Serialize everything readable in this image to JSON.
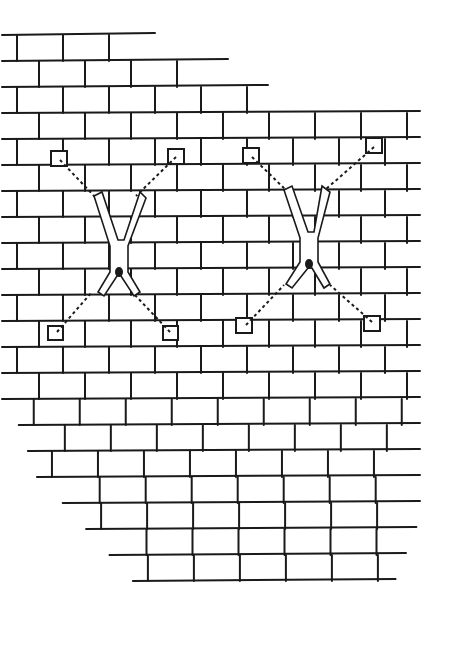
{
  "illustration": {
    "subject": "two figures chained spread-eagle upside-down to a brick wall",
    "style": "black ink line drawing on white",
    "colors": {
      "ink": "#1a1a1a",
      "paper": "#ffffff"
    },
    "figures": [
      {
        "name": "left-figure",
        "anchors": [
          [
            60,
            158
          ],
          [
            178,
            155
          ],
          [
            55,
            330
          ],
          [
            172,
            332
          ]
        ]
      },
      {
        "name": "right-figure",
        "anchors": [
          [
            252,
            155
          ],
          [
            375,
            145
          ],
          [
            244,
            325
          ],
          [
            372,
            322
          ]
        ]
      }
    ]
  }
}
